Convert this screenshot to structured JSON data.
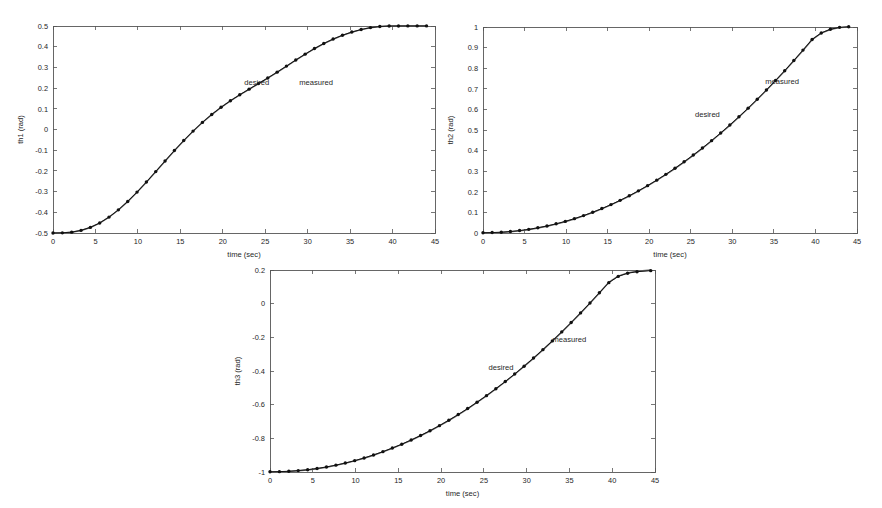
{
  "figure": {
    "background_color": "#ffffff",
    "desired_color": "#6e6e6e",
    "measured_color": "#111111",
    "axis_color": "#555555"
  },
  "charts": [
    {
      "id": "th1",
      "type": "line",
      "title": "",
      "xlabel": "time (sec)",
      "ylabel": "th1 (rad)",
      "xlim": [
        0,
        45
      ],
      "ylim": [
        -0.5,
        0.5
      ],
      "xticks": [
        0,
        5,
        10,
        15,
        20,
        25,
        30,
        35,
        40,
        45
      ],
      "xticklabels": [
        "0",
        "5",
        "10",
        "15",
        "20",
        "25",
        "30",
        "35",
        "40",
        "45"
      ],
      "yticks": [
        -0.5,
        -0.4,
        -0.3,
        -0.2,
        -0.1,
        0,
        0.1,
        0.2,
        0.3,
        0.4,
        0.5
      ],
      "yticklabels": [
        "-0.5",
        "-0.4",
        "-0.3",
        "-0.2",
        "-0.1",
        "0",
        "0.1",
        "0.2",
        "0.3",
        "0.4",
        "0.5"
      ],
      "grid": false,
      "annotations": [
        {
          "text": "desired",
          "x": 24.0,
          "y": 0.215
        },
        {
          "text": "measured",
          "x": 31.0,
          "y": 0.215
        }
      ],
      "series": [
        {
          "name": "desired",
          "x": [
            0,
            1.1,
            2.2,
            3.3,
            4.4,
            5.5,
            6.6,
            7.7,
            8.8,
            9.9,
            11.0,
            12.1,
            13.2,
            14.3,
            15.4,
            16.5,
            17.6,
            18.7,
            19.8,
            20.9,
            22.0,
            23.1,
            24.2,
            25.3,
            26.4,
            27.5,
            28.6,
            29.7,
            30.8,
            31.9,
            33.0,
            34.1,
            35.2,
            36.3,
            37.4,
            38.5,
            39.6,
            40.7,
            41.8,
            42.9,
            44.0
          ],
          "values": [
            -0.5,
            -0.4995,
            -0.4962,
            -0.4879,
            -0.4735,
            -0.4522,
            -0.4239,
            -0.3891,
            -0.3485,
            -0.3033,
            -0.2547,
            -0.2042,
            -0.1531,
            -0.1027,
            -0.0542,
            -0.0085,
            0.0337,
            0.0721,
            0.1067,
            0.1381,
            0.1669,
            0.1942,
            0.2209,
            0.2481,
            0.2763,
            0.3054,
            0.3347,
            0.3633,
            0.3902,
            0.4147,
            0.4362,
            0.4547,
            0.4701,
            0.4824,
            0.4917,
            0.4971,
            0.4994,
            0.5,
            0.5,
            0.5,
            0.5
          ]
        },
        {
          "name": "measured",
          "x": [
            0,
            1.1,
            2.2,
            3.3,
            4.4,
            5.5,
            6.6,
            7.7,
            8.8,
            9.9,
            11.0,
            12.1,
            13.2,
            14.3,
            15.4,
            16.5,
            17.6,
            18.7,
            19.8,
            20.9,
            22.0,
            23.1,
            24.2,
            25.3,
            26.4,
            27.5,
            28.6,
            29.7,
            30.8,
            31.9,
            33.0,
            34.1,
            35.2,
            36.3,
            37.4,
            38.5,
            39.6,
            40.7,
            41.8,
            42.9,
            44.0
          ],
          "values": [
            -0.4998,
            -0.4992,
            -0.4958,
            -0.4874,
            -0.4729,
            -0.4515,
            -0.4231,
            -0.3882,
            -0.3476,
            -0.3024,
            -0.2538,
            -0.2033,
            -0.1522,
            -0.1018,
            -0.0534,
            -0.0078,
            0.0344,
            0.0728,
            0.1074,
            0.1389,
            0.1677,
            0.195,
            0.2217,
            0.2489,
            0.2771,
            0.3062,
            0.3355,
            0.3641,
            0.391,
            0.4154,
            0.4369,
            0.4554,
            0.4707,
            0.483,
            0.4922,
            0.4976,
            0.4998,
            0.5003,
            0.5004,
            0.5004,
            0.5004
          ]
        }
      ]
    },
    {
      "id": "th2",
      "type": "line",
      "title": "",
      "xlabel": "time (sec)",
      "ylabel": "th2 (rad)",
      "xlim": [
        0,
        45
      ],
      "ylim": [
        0,
        1
      ],
      "xticks": [
        0,
        5,
        10,
        15,
        20,
        25,
        30,
        35,
        40,
        45
      ],
      "xticklabels": [
        "0",
        "5",
        "10",
        "15",
        "20",
        "25",
        "30",
        "35",
        "40",
        "45"
      ],
      "yticks": [
        0,
        0.1,
        0.2,
        0.3,
        0.4,
        0.5,
        0.6,
        0.7,
        0.8,
        0.9,
        1
      ],
      "yticklabels": [
        "0",
        "0.1",
        "0.2",
        "0.3",
        "0.4",
        "0.5",
        "0.6",
        "0.7",
        "0.8",
        "0.9",
        "1"
      ],
      "grid": false,
      "annotations": [
        {
          "text": "desired",
          "x": 27.0,
          "y": 0.565
        },
        {
          "text": "measured",
          "x": 36.0,
          "y": 0.725
        }
      ],
      "series": [
        {
          "name": "desired",
          "x": [
            0,
            1.1,
            2.2,
            3.3,
            4.4,
            5.5,
            6.6,
            7.7,
            8.8,
            9.9,
            11.0,
            12.1,
            13.2,
            14.3,
            15.4,
            16.5,
            17.6,
            18.7,
            19.8,
            20.9,
            22.0,
            23.1,
            24.2,
            25.3,
            26.4,
            27.5,
            28.6,
            29.7,
            30.8,
            31.9,
            33.0,
            34.1,
            35.2,
            36.3,
            37.4,
            38.5,
            39.6,
            40.7,
            41.8,
            42.9,
            44.0
          ],
          "values": [
            0,
            0.0006,
            0.0025,
            0.0057,
            0.0103,
            0.0163,
            0.0238,
            0.0327,
            0.0431,
            0.0549,
            0.0682,
            0.083,
            0.0993,
            0.1171,
            0.1363,
            0.1571,
            0.1793,
            0.2031,
            0.2283,
            0.255,
            0.2833,
            0.313,
            0.3442,
            0.3769,
            0.4111,
            0.4468,
            0.484,
            0.5227,
            0.5629,
            0.6046,
            0.6478,
            0.6925,
            0.7387,
            0.7864,
            0.8356,
            0.8863,
            0.9385,
            0.97,
            0.988,
            0.997,
            1.0
          ]
        },
        {
          "name": "measured",
          "x": [
            0,
            1.1,
            2.2,
            3.3,
            4.4,
            5.5,
            6.6,
            7.7,
            8.8,
            9.9,
            11.0,
            12.1,
            13.2,
            14.3,
            15.4,
            16.5,
            17.6,
            18.7,
            19.8,
            20.9,
            22.0,
            23.1,
            24.2,
            25.3,
            26.4,
            27.5,
            28.6,
            29.7,
            30.8,
            31.9,
            33.0,
            34.1,
            35.2,
            36.3,
            37.4,
            38.5,
            39.6,
            40.7,
            41.8,
            42.9,
            44.0
          ],
          "values": [
            0.0015,
            0.0021,
            0.004,
            0.0072,
            0.0118,
            0.0178,
            0.0253,
            0.0342,
            0.0446,
            0.0564,
            0.0697,
            0.0845,
            0.1008,
            0.1186,
            0.1378,
            0.1586,
            0.1808,
            0.2046,
            0.2298,
            0.2565,
            0.2848,
            0.3145,
            0.3457,
            0.3784,
            0.4126,
            0.4483,
            0.4855,
            0.5242,
            0.5644,
            0.6061,
            0.6493,
            0.694,
            0.7402,
            0.7879,
            0.8371,
            0.8878,
            0.9395,
            0.9712,
            0.9892,
            0.9982,
            1.0012
          ]
        }
      ]
    },
    {
      "id": "th3",
      "type": "line",
      "title": "",
      "xlabel": "time (sec)",
      "ylabel": "th3 (rad)",
      "xlim": [
        0,
        45
      ],
      "ylim": [
        -1,
        0.2
      ],
      "xticks": [
        0,
        5,
        10,
        15,
        20,
        25,
        30,
        35,
        40,
        45
      ],
      "xticklabels": [
        "0",
        "5",
        "10",
        "15",
        "20",
        "25",
        "30",
        "35",
        "40",
        "45"
      ],
      "yticks": [
        -1,
        -0.8,
        -0.6,
        -0.4,
        -0.2,
        0,
        0.2
      ],
      "yticklabels": [
        "-1",
        "-0.8",
        "-0.6",
        "-0.4",
        "-0.2",
        "0",
        "0.2"
      ],
      "grid": false,
      "annotations": [
        {
          "text": "desired",
          "x": 27.0,
          "y": -0.395
        },
        {
          "text": "measured",
          "x": 35.0,
          "y": -0.225
        }
      ],
      "series": [
        {
          "name": "desired",
          "x": [
            0,
            1.1,
            2.2,
            3.3,
            4.4,
            5.5,
            6.6,
            7.7,
            8.8,
            9.9,
            11.0,
            12.1,
            13.2,
            14.3,
            15.4,
            16.5,
            17.6,
            18.7,
            19.8,
            20.9,
            22.0,
            23.1,
            24.2,
            25.3,
            26.4,
            27.5,
            28.6,
            29.7,
            30.8,
            31.9,
            33.0,
            34.1,
            35.2,
            36.3,
            37.4,
            38.5,
            39.6,
            40.7,
            41.8,
            42.9,
            44.5
          ],
          "values": [
            -1.0,
            -0.9993,
            -0.997,
            -0.9931,
            -0.9876,
            -0.9804,
            -0.9714,
            -0.9607,
            -0.9482,
            -0.934,
            -0.918,
            -0.9002,
            -0.8806,
            -0.8592,
            -0.8362,
            -0.8113,
            -0.7847,
            -0.7563,
            -0.726,
            -0.694,
            -0.6601,
            -0.6245,
            -0.587,
            -0.5478,
            -0.5067,
            -0.4639,
            -0.4193,
            -0.3728,
            -0.3246,
            -0.2745,
            -0.2227,
            -0.169,
            -0.1136,
            -0.0563,
            0.0028,
            0.0637,
            0.1265,
            0.164,
            0.183,
            0.193,
            0.2
          ]
        },
        {
          "name": "measured",
          "x": [
            0,
            1.1,
            2.2,
            3.3,
            4.4,
            5.5,
            6.6,
            7.7,
            8.8,
            9.9,
            11.0,
            12.1,
            13.2,
            14.3,
            15.4,
            16.5,
            17.6,
            18.7,
            19.8,
            20.9,
            22.0,
            23.1,
            24.2,
            25.3,
            26.4,
            27.5,
            28.6,
            29.7,
            30.8,
            31.9,
            33.0,
            34.1,
            35.2,
            36.3,
            37.4,
            38.5,
            39.6,
            40.7,
            41.8,
            42.9,
            44.5
          ],
          "values": [
            -0.9985,
            -0.9978,
            -0.9956,
            -0.9917,
            -0.9862,
            -0.979,
            -0.97,
            -0.9592,
            -0.9468,
            -0.9326,
            -0.9166,
            -0.8988,
            -0.8792,
            -0.8578,
            -0.8348,
            -0.8099,
            -0.7833,
            -0.7549,
            -0.7246,
            -0.6926,
            -0.6587,
            -0.6231,
            -0.5856,
            -0.5464,
            -0.5053,
            -0.4625,
            -0.4179,
            -0.3714,
            -0.3232,
            -0.2731,
            -0.2213,
            -0.1676,
            -0.1122,
            -0.0549,
            0.0042,
            0.0651,
            0.125,
            0.162,
            0.1805,
            0.19,
            0.196
          ]
        }
      ]
    }
  ]
}
